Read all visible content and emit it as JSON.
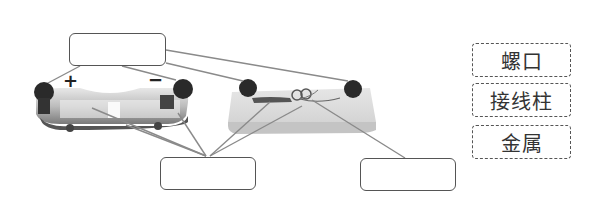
{
  "diagram": {
    "title": "",
    "components": [
      {
        "name": "battery-holder",
        "polarity_labels": {
          "positive": "+",
          "negative": "−"
        }
      },
      {
        "name": "bulb-holder"
      }
    ],
    "answer_boxes": [
      {
        "id": "top",
        "value": ""
      },
      {
        "id": "bottom-middle",
        "value": ""
      },
      {
        "id": "bottom-right",
        "value": ""
      }
    ],
    "word_bank": [
      {
        "label": "螺口"
      },
      {
        "label": "接线柱"
      },
      {
        "label": "金属"
      }
    ],
    "colors": {
      "line": "#8a8a8a",
      "box_border": "#555555",
      "post": "#2a2a2a"
    }
  }
}
